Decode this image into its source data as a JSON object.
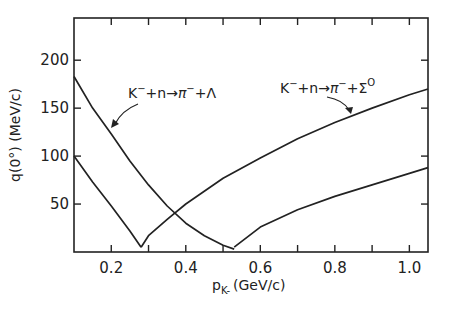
{
  "chart_data": {
    "type": "line",
    "title": "",
    "xlabel": "p_K- (GeV/c)",
    "xlabel_main": "p",
    "xlabel_sub": "K-",
    "xlabel_unit": "(GeV/c)",
    "ylabel": "q(0°) (MeV/c)",
    "xlim": [
      0.1,
      1.05
    ],
    "ylim": [
      0,
      244
    ],
    "xticks": [
      0.2,
      0.4,
      0.6,
      0.8,
      1.0
    ],
    "xtick_labels": [
      "0.2",
      "0.4",
      "0.6",
      "0.8",
      "1.0"
    ],
    "xminor": [
      0.3,
      0.5,
      0.7,
      0.9
    ],
    "yticks": [
      50,
      100,
      150,
      200
    ],
    "ytick_labels": [
      "50",
      "100",
      "150",
      "200"
    ],
    "grid": false,
    "legend": "none (inline annotations)",
    "series": [
      {
        "name": "K- + n → π- + Λ",
        "x": [
          0.1,
          0.15,
          0.2,
          0.25,
          0.3,
          0.35,
          0.4,
          0.45,
          0.5,
          0.53
        ],
        "y": [
          183,
          150,
          123,
          95,
          70,
          48,
          30,
          17,
          7,
          3
        ]
      },
      {
        "name": "K- + n → π- + Λ (lower branch)",
        "x": [
          0.1,
          0.15,
          0.2,
          0.25,
          0.28
        ],
        "y": [
          100,
          73,
          48,
          22,
          5
        ]
      },
      {
        "name": "K- + n → π- + Λ (rising branch)",
        "x": [
          0.28,
          0.3,
          0.35,
          0.4,
          0.5,
          0.6,
          0.7,
          0.8,
          0.9,
          1.0,
          1.05
        ],
        "y": [
          5,
          17,
          34,
          50,
          77,
          98,
          118,
          135,
          150,
          164,
          170
        ]
      },
      {
        "name": "K- + n → π- + Σ0",
        "x": [
          0.53,
          0.6,
          0.7,
          0.8,
          0.9,
          1.0,
          1.05
        ],
        "y": [
          5,
          26,
          44,
          58,
          70,
          82,
          88
        ]
      }
    ],
    "annotations": [
      {
        "text_parts": [
          "K",
          "−",
          "+n→",
          "π",
          "−",
          "+Λ"
        ],
        "x": 0.12,
        "y": 150
      },
      {
        "text_parts": [
          "K",
          "−",
          "+n→",
          "π",
          "−",
          "+Σ",
          "O"
        ],
        "x": 0.65,
        "y": 160
      }
    ]
  }
}
